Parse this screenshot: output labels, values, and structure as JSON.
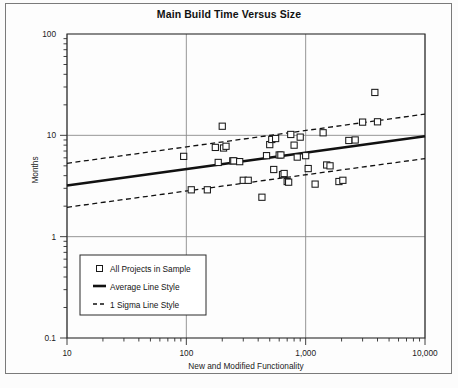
{
  "figure": {
    "title": "Main Build Time Versus Size",
    "has_outer_border": true,
    "background_color": "#fdfdfd",
    "ink_color": "#1a1a1a"
  },
  "axes": {
    "x": {
      "label": "New and Modified Functionality",
      "scale": "log",
      "min": 10,
      "max": 10000,
      "tick_labels": [
        "10",
        "100",
        "1,000",
        "10,000"
      ],
      "tick_values": [
        10,
        100,
        1000,
        10000
      ],
      "gridlines": true
    },
    "y": {
      "label": "Months",
      "scale": "log",
      "min": 0.1,
      "max": 100,
      "tick_labels": [
        "100",
        "10",
        "1",
        "0.1"
      ],
      "tick_values": [
        100,
        10,
        1,
        0.1
      ],
      "gridlines": true
    }
  },
  "legend": {
    "position": "lower-left",
    "entries": [
      {
        "marker": "open-square",
        "label": "All Projects in Sample"
      },
      {
        "marker": "solid-line",
        "label": "Average Line Style"
      },
      {
        "marker": "dashed-line",
        "label": "1 Sigma Line Style"
      }
    ]
  },
  "chart_data": {
    "type": "scatter",
    "title": "Main Build Time Versus Size",
    "xlabel": "New and Modified Functionality",
    "ylabel": "Months",
    "xscale": "log",
    "yscale": "log",
    "xlim": [
      10,
      10000
    ],
    "ylim": [
      0.1,
      100
    ],
    "grid": true,
    "legend_position": "lower-left",
    "series": [
      {
        "name": "All Projects in Sample",
        "type": "scatter",
        "marker": "open-square",
        "points": [
          [
            95,
            6.2
          ],
          [
            110,
            2.9
          ],
          [
            150,
            2.9
          ],
          [
            175,
            7.6
          ],
          [
            185,
            5.4
          ],
          [
            200,
            12.3
          ],
          [
            205,
            7.5
          ],
          [
            215,
            7.8
          ],
          [
            245,
            5.6
          ],
          [
            250,
            5.6
          ],
          [
            280,
            5.5
          ],
          [
            300,
            3.6
          ],
          [
            330,
            3.6
          ],
          [
            430,
            2.45
          ],
          [
            470,
            6.3
          ],
          [
            500,
            8.1
          ],
          [
            520,
            9.1
          ],
          [
            540,
            4.6
          ],
          [
            560,
            9.3
          ],
          [
            600,
            6.4
          ],
          [
            620,
            6.4
          ],
          [
            640,
            4.1
          ],
          [
            660,
            4.2
          ],
          [
            700,
            3.5
          ],
          [
            720,
            3.45
          ],
          [
            750,
            10.2
          ],
          [
            800,
            8.0
          ],
          [
            850,
            6.1
          ],
          [
            900,
            9.6
          ],
          [
            1000,
            6.3
          ],
          [
            1050,
            4.7
          ],
          [
            1200,
            3.3
          ],
          [
            1400,
            10.6
          ],
          [
            1500,
            5.1
          ],
          [
            1600,
            5.0
          ],
          [
            1900,
            3.5
          ],
          [
            2050,
            3.6
          ],
          [
            2300,
            8.9
          ],
          [
            2600,
            9.0
          ],
          [
            3000,
            13.5
          ],
          [
            3800,
            26.5
          ],
          [
            4000,
            13.6
          ]
        ]
      },
      {
        "name": "Average Line Style",
        "type": "line",
        "style": "solid",
        "endpoints": [
          [
            10,
            3.2
          ],
          [
            10000,
            9.8
          ]
        ]
      },
      {
        "name": "1 Sigma Line Style",
        "type": "line",
        "style": "dashed",
        "upper_endpoints": [
          [
            10,
            5.3
          ],
          [
            10000,
            16.2
          ]
        ],
        "lower_endpoints": [
          [
            10,
            1.95
          ],
          [
            10000,
            5.9
          ]
        ]
      }
    ]
  }
}
